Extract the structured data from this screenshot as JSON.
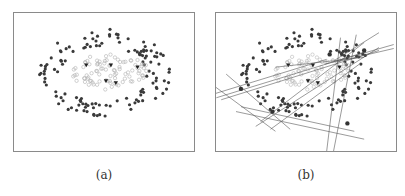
{
  "figure": {
    "panels": [
      {
        "id": "a",
        "caption": "(a)",
        "description": "Two-class point cloud: outer ring of dark filled dots surrounding an inner cluster of light hollow circles/squares, with a few dark triangle markers in the center",
        "series": [
          {
            "name": "outer-ring",
            "marker": "filled-dot",
            "color": "#3a3a3a",
            "count": 130
          },
          {
            "name": "inner-cluster",
            "marker": "hollow-circle",
            "color": "#b0b0b0",
            "count": 90
          },
          {
            "name": "centers",
            "marker": "triangle-down",
            "color": "#222222",
            "count": 5
          }
        ]
      },
      {
        "id": "b",
        "caption": "(b)",
        "description": "Same point cloud with multiple straight lines (hyperplanes) drawn through selected outer points, forming intersecting line bundles",
        "series": [
          {
            "name": "outer-ring",
            "marker": "filled-dot",
            "color": "#3a3a3a",
            "count": 130
          },
          {
            "name": "inner-cluster",
            "marker": "hollow-circle",
            "color": "#b8b8b8",
            "count": 90
          },
          {
            "name": "centers",
            "marker": "triangle-down",
            "color": "#222222",
            "count": 5
          },
          {
            "name": "lines",
            "marker": "line",
            "color": "#555555",
            "count": 16
          }
        ]
      }
    ],
    "colors": {
      "border": "#8a8a8a",
      "dark": "#3a3a3a",
      "light": "#b0b0b0",
      "line": "#555555"
    }
  }
}
